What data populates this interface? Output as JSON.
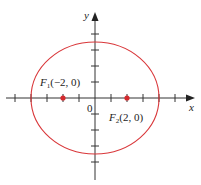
{
  "figure": {
    "type": "ellipse-with-foci",
    "equation": "x^2/16 + y^2/12 = 1",
    "axes": {
      "x_label": "x",
      "y_label": "y",
      "origin_label": "0",
      "tick_spacing_units": 1,
      "x_ticks": [
        -5,
        -4,
        -3,
        -2,
        -1,
        1,
        2,
        3,
        4,
        5
      ],
      "y_ticks": [
        -4,
        -3,
        -2,
        -1,
        1,
        2,
        3,
        4
      ]
    },
    "ellipse": {
      "center": [
        0,
        0
      ],
      "semi_major": 4,
      "semi_minor": 3.46,
      "color": "#d9373a"
    },
    "foci": [
      {
        "name": "F",
        "subscript": "1",
        "coords": "(−2, 0)",
        "x": -2,
        "y": 0
      },
      {
        "name": "F",
        "subscript": "2",
        "coords": "(2, 0)",
        "x": 2,
        "y": 0
      }
    ],
    "colors": {
      "axis": "#333333",
      "curve": "#d9373a",
      "focus_point": "#d42a2e"
    }
  }
}
